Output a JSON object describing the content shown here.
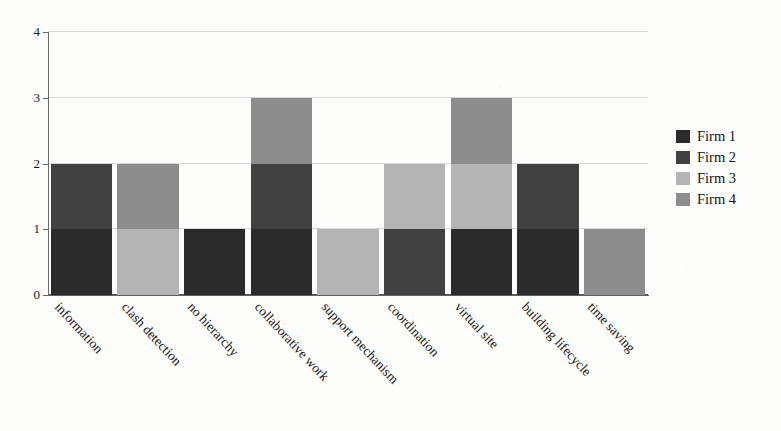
{
  "chart_data": {
    "type": "bar",
    "subtype": "stacked-bar",
    "title": "",
    "subtitle": "",
    "xlabel": "",
    "ylabel": "",
    "ylim": [
      0,
      4
    ],
    "yticks": [
      0,
      1,
      2,
      3,
      4
    ],
    "ytick_labels": [
      "0",
      "1",
      "2",
      "3",
      "4"
    ],
    "grid": true,
    "grid_axis": "y",
    "legend_position": "right",
    "categories": [
      "information",
      "clash detection",
      "no hierarchy",
      "collaborative work",
      "support mechanism",
      "coordination",
      "virtual site",
      "building lifecycle",
      "time saving"
    ],
    "series": [
      {
        "name": "Firm 1",
        "color": "#2b2b2b",
        "values": [
          1,
          0,
          1,
          1,
          0,
          0,
          1,
          1,
          0
        ]
      },
      {
        "name": "Firm 2",
        "color": "#414141",
        "values": [
          1,
          0,
          0,
          1,
          0,
          1,
          0,
          1,
          0
        ]
      },
      {
        "name": "Firm 3",
        "color": "#b4b4b4",
        "values": [
          0,
          1,
          0,
          0,
          1,
          1,
          1,
          0,
          0
        ]
      },
      {
        "name": "Firm 4",
        "color": "#8d8d8d",
        "values": [
          0,
          1,
          0,
          1,
          0,
          0,
          1,
          0,
          1
        ]
      }
    ],
    "totals": [
      2,
      2,
      1,
      3,
      1,
      2,
      3,
      2,
      1
    ],
    "stack_order": [
      "Firm 1",
      "Firm 2",
      "Firm 3",
      "Firm 4"
    ],
    "colors": {
      "firm1": "#2b2b2b",
      "firm2": "#414141",
      "firm3": "#b4b4b4",
      "firm4": "#8d8d8d",
      "gridline": "#d8d8d8",
      "axis": "#5f5f5f",
      "background": "#fdfdfc",
      "text": "#151515"
    }
  },
  "legend": {
    "items": [
      {
        "label": "Firm 1",
        "color": "#2b2b2b"
      },
      {
        "label": "Firm 2",
        "color": "#414141"
      },
      {
        "label": "Firm 3",
        "color": "#b4b4b4"
      },
      {
        "label": "Firm 4",
        "color": "#8d8d8d"
      }
    ]
  },
  "axes": {
    "y_tick_labels": [
      "0",
      "1",
      "2",
      "3",
      "4"
    ],
    "x_tick_labels": [
      "information",
      "clash detection",
      "no hierarchy",
      "collaborative work",
      "support mechanism",
      "coordination",
      "virtual site",
      "building lifecycle",
      "time saving"
    ]
  }
}
